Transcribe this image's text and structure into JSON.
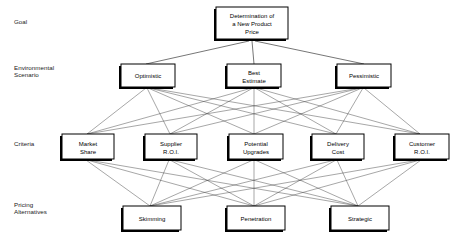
{
  "diagram": {
    "type": "ahp-hierarchy",
    "levels": [
      {
        "id": "goal",
        "label_lines": [
          "Goal"
        ],
        "label_line1": "Goal",
        "label_line2": "",
        "nodes": [
          {
            "id": "goal-node",
            "lines": [
              "Determination of",
              "a New Product",
              "Price"
            ],
            "line1": "Determination of",
            "line2": "a New Product",
            "line3": "Price"
          }
        ]
      },
      {
        "id": "environmental-scenario",
        "label_lines": [
          "Environmental",
          "Scenario"
        ],
        "label_line1": "Environmental",
        "label_line2": "Scenario",
        "nodes": [
          {
            "id": "optimistic",
            "lines": [
              "Optimistic"
            ],
            "line1": "Optimistic",
            "line2": ""
          },
          {
            "id": "best-estimate",
            "lines": [
              "Best",
              "Estimate"
            ],
            "line1": "Best",
            "line2": "Estimate"
          },
          {
            "id": "pessimistic",
            "lines": [
              "Pessimistic"
            ],
            "line1": "Pessimistic",
            "line2": ""
          }
        ]
      },
      {
        "id": "criteria",
        "label_lines": [
          "Criteria"
        ],
        "label_line1": "Criteria",
        "label_line2": "",
        "nodes": [
          {
            "id": "market-share",
            "lines": [
              "Market",
              "Share"
            ],
            "line1": "Market",
            "line2": "Share"
          },
          {
            "id": "supplier-roi",
            "lines": [
              "Supplier",
              "R.O.I."
            ],
            "line1": "Supplier",
            "line2": "R.O.I."
          },
          {
            "id": "potential-upgrades",
            "lines": [
              "Potential",
              "Upgrades"
            ],
            "line1": "Potential",
            "line2": "Upgrades"
          },
          {
            "id": "delivery-cost",
            "lines": [
              "Delivery",
              "Cost"
            ],
            "line1": "Delivery",
            "line2": "Cost"
          },
          {
            "id": "customer-roi",
            "lines": [
              "Customer",
              "R.O.I."
            ],
            "line1": "Customer",
            "line2": "R.O.I."
          }
        ]
      },
      {
        "id": "pricing-alternatives",
        "label_lines": [
          "Pricing",
          "Alternatives"
        ],
        "label_line1": "Pricing",
        "label_line2": "Alternatives",
        "nodes": [
          {
            "id": "skimming",
            "lines": [
              "Skimming"
            ],
            "line1": "Skimming",
            "line2": ""
          },
          {
            "id": "penetration",
            "lines": [
              "Penetration"
            ],
            "line1": "Penetration",
            "line2": ""
          },
          {
            "id": "strategic",
            "lines": [
              "Strategic"
            ],
            "line1": "Strategic",
            "line2": ""
          }
        ]
      }
    ],
    "colors": {
      "background": "#ffffff",
      "box_fill": "#ffffff",
      "box_stroke": "#000000",
      "box_shadow": "#000000",
      "link": "#3a3a3a",
      "text": "#000000"
    }
  }
}
